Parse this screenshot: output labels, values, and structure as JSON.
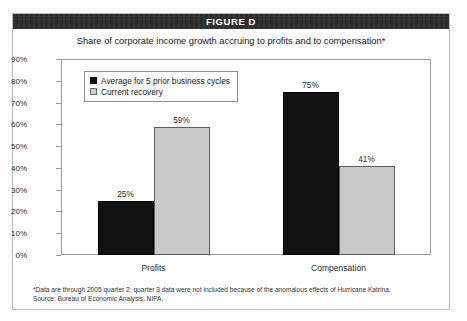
{
  "figure": {
    "banner_label": "FIGURE D",
    "subtitle": "Share of corporate income growth accruing to profits and to compensation*",
    "footnotes": [
      "*Data are through 2005 quarter 2; quarter 3 data were not included because of the anomalous effects of Hurricane Katrina.",
      "Source: Bureau of Economic Analysis, NIPA."
    ]
  },
  "colors": {
    "banner_background": "#2a2a2a",
    "banner_text": "#ffffff",
    "series_dark": "#111111",
    "series_light": "#c9c9c9",
    "axis": "#9a9a9a",
    "frame": "#b9b9b9"
  },
  "chart_data": {
    "type": "bar",
    "title": "Share of corporate income growth accruing to profits and to compensation*",
    "xlabel": "",
    "ylabel": "",
    "categories": [
      "Profits",
      "Compensation"
    ],
    "series": [
      {
        "name": "Average for 5 prior business cycles",
        "values": [
          25,
          75
        ],
        "color": "#111111"
      },
      {
        "name": "Current recovery",
        "values": [
          59,
          41
        ],
        "color": "#c9c9c9"
      }
    ],
    "value_labels": [
      [
        "25%",
        "59%"
      ],
      [
        "75%",
        "41%"
      ]
    ],
    "ylim": [
      0,
      90
    ],
    "yticks": [
      0,
      10,
      20,
      30,
      40,
      50,
      60,
      70,
      80,
      90
    ],
    "ytick_labels": [
      "0%",
      "10%",
      "20%",
      "30%",
      "40%",
      "50%",
      "60%",
      "70%",
      "80%",
      "90%"
    ],
    "grid": false,
    "legend_position": "upper left",
    "unit": "percent"
  }
}
